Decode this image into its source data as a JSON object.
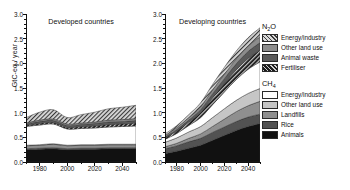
{
  "axes": {
    "ylabel": "GtC-eq / year",
    "yticks": [
      0.0,
      0.5,
      1.0,
      1.5,
      2.0,
      2.5,
      3.0
    ],
    "yticklabels": [
      "0.0",
      "0.5",
      "1.0",
      "1.5",
      "2.0",
      "2.5",
      "3.0"
    ],
    "ylim": [
      0.0,
      3.0
    ],
    "xticks": [
      1980,
      2000,
      2020,
      2040
    ],
    "xticklabels": [
      "1980",
      "2000",
      "2020",
      "2040"
    ],
    "xlim": [
      1970,
      2050
    ]
  },
  "panels": {
    "left": {
      "title": "Developed countries"
    },
    "right": {
      "title": "Developing countries"
    }
  },
  "legend": {
    "groups": [
      {
        "title": "N",
        "title_sub": "2",
        "title_tail": "O",
        "name": "n2o",
        "items": [
          {
            "label": "Energy/industry",
            "fill": "#d9d9d9",
            "hatch": true
          },
          {
            "label": "Other land use",
            "fill": "#8c8c8c",
            "hatch": false
          },
          {
            "label": "Animal waste",
            "fill": "#5a5a5a",
            "hatch": false
          },
          {
            "label": "Fertiliser",
            "fill": "#1c1c1c",
            "hatch": true
          }
        ]
      },
      {
        "title": "CH",
        "title_sub": "4",
        "title_tail": "",
        "name": "ch4",
        "items": [
          {
            "label": "Energy/industry",
            "fill": "#ffffff",
            "hatch": false
          },
          {
            "label": "Other land use",
            "fill": "#c6c6c6",
            "hatch": false
          },
          {
            "label": "Landfills",
            "fill": "#8f8f8f",
            "hatch": false
          },
          {
            "label": "Rice",
            "fill": "#525252",
            "hatch": false
          },
          {
            "label": "Animals",
            "fill": "#111111",
            "hatch": false
          }
        ]
      }
    ]
  },
  "chart_data": {
    "type": "area",
    "title": "",
    "xlabel": "",
    "ylabel": "GtC-eq / year",
    "ylim": [
      0.0,
      3.0
    ],
    "xlim": [
      1970,
      2050
    ],
    "grid": false,
    "legend_position": "right",
    "stacking": "stacked",
    "x": [
      1970,
      1980,
      1990,
      2000,
      2010,
      2020,
      2030,
      2040,
      2050
    ],
    "panels": [
      {
        "name": "Developed countries",
        "series": [
          {
            "name": "CH4 Animals",
            "gas": "CH4",
            "values": [
              0.25,
              0.26,
              0.27,
              0.25,
              0.26,
              0.26,
              0.27,
              0.27,
              0.27
            ]
          },
          {
            "name": "CH4 Rice",
            "gas": "CH4",
            "values": [
              0.02,
              0.02,
              0.02,
              0.02,
              0.02,
              0.02,
              0.02,
              0.02,
              0.02
            ]
          },
          {
            "name": "CH4 Landfills",
            "gas": "CH4",
            "values": [
              0.06,
              0.06,
              0.07,
              0.06,
              0.06,
              0.06,
              0.06,
              0.06,
              0.06
            ]
          },
          {
            "name": "CH4 Other land use",
            "gas": "CH4",
            "values": [
              0.01,
              0.01,
              0.01,
              0.01,
              0.01,
              0.01,
              0.01,
              0.01,
              0.01
            ]
          },
          {
            "name": "CH4 Energy/industry",
            "gas": "CH4",
            "values": [
              0.38,
              0.4,
              0.4,
              0.33,
              0.33,
              0.34,
              0.35,
              0.36,
              0.37
            ]
          },
          {
            "name": "N2O Fertiliser",
            "gas": "N2O",
            "values": [
              0.02,
              0.03,
              0.03,
              0.03,
              0.04,
              0.04,
              0.05,
              0.05,
              0.06
            ]
          },
          {
            "name": "N2O Animal waste",
            "gas": "N2O",
            "values": [
              0.03,
              0.04,
              0.04,
              0.04,
              0.04,
              0.05,
              0.05,
              0.05,
              0.05
            ]
          },
          {
            "name": "N2O Other land use",
            "gas": "N2O",
            "values": [
              0.02,
              0.03,
              0.03,
              0.03,
              0.03,
              0.03,
              0.04,
              0.04,
              0.04
            ]
          },
          {
            "name": "N2O Energy/industry",
            "gas": "N2O",
            "values": [
              0.11,
              0.16,
              0.19,
              0.13,
              0.17,
              0.2,
              0.23,
              0.25,
              0.27
            ]
          }
        ],
        "totals": [
          0.7,
          0.82,
          0.88,
          0.72,
          0.83,
          0.9,
          1.01,
          1.08,
          1.15
        ]
      },
      {
        "name": "Developing countries",
        "series": [
          {
            "name": "CH4 Animals",
            "gas": "CH4",
            "values": [
              0.17,
              0.22,
              0.28,
              0.34,
              0.44,
              0.54,
              0.64,
              0.72,
              0.78
            ]
          },
          {
            "name": "CH4 Rice",
            "gas": "CH4",
            "values": [
              0.1,
              0.11,
              0.13,
              0.14,
              0.16,
              0.17,
              0.18,
              0.19,
              0.19
            ]
          },
          {
            "name": "CH4 Landfills",
            "gas": "CH4",
            "values": [
              0.04,
              0.05,
              0.07,
              0.09,
              0.12,
              0.16,
              0.2,
              0.23,
              0.26
            ]
          },
          {
            "name": "CH4 Other land use",
            "gas": "CH4",
            "values": [
              0.09,
              0.11,
              0.13,
              0.15,
              0.18,
              0.21,
              0.23,
              0.25,
              0.26
            ]
          },
          {
            "name": "CH4 Energy/industry",
            "gas": "CH4",
            "values": [
              0.06,
              0.09,
              0.13,
              0.18,
              0.26,
              0.34,
              0.42,
              0.49,
              0.54
            ]
          },
          {
            "name": "N2O Fertiliser",
            "gas": "N2O",
            "values": [
              0.03,
              0.05,
              0.07,
              0.1,
              0.14,
              0.17,
              0.2,
              0.22,
              0.24
            ]
          },
          {
            "name": "N2O Animal waste",
            "gas": "N2O",
            "values": [
              0.02,
              0.03,
              0.04,
              0.06,
              0.08,
              0.1,
              0.12,
              0.14,
              0.15
            ]
          },
          {
            "name": "N2O Other land use",
            "gas": "N2O",
            "values": [
              0.03,
              0.04,
              0.05,
              0.06,
              0.08,
              0.09,
              0.1,
              0.11,
              0.12
            ]
          },
          {
            "name": "N2O Energy/industry",
            "gas": "N2O",
            "values": [
              0.03,
              0.04,
              0.06,
              0.08,
              0.11,
              0.14,
              0.16,
              0.17,
              0.18
            ]
          }
        ],
        "totals": [
          0.57,
          0.74,
          0.96,
          1.2,
          1.57,
          1.92,
          2.25,
          2.52,
          2.72
        ]
      }
    ]
  }
}
